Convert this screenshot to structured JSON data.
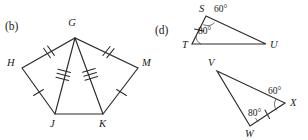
{
  "figures": [
    {
      "id": "figure-b",
      "part_label": "(b)",
      "shape": "pentagon-with-cevians",
      "vertices": [
        {
          "name": "G",
          "label": "G",
          "x": 75,
          "y": 38,
          "label_x": 72,
          "label_y": 26
        },
        {
          "name": "H",
          "label": "H",
          "x": 22,
          "y": 68,
          "label_x": 7,
          "label_y": 66
        },
        {
          "name": "M",
          "label": "M",
          "x": 138,
          "y": 68,
          "label_x": 142,
          "label_y": 66
        },
        {
          "name": "J",
          "label": "J",
          "x": 55,
          "y": 114,
          "label_x": 50,
          "label_y": 127
        },
        {
          "name": "K",
          "label": "K",
          "x": 103,
          "y": 114,
          "label_x": 99,
          "label_y": 127
        }
      ],
      "segments": [
        {
          "name": "HG",
          "from": "H",
          "to": "G",
          "ticks": 2
        },
        {
          "name": "GM",
          "from": "G",
          "to": "M",
          "ticks": 2
        },
        {
          "name": "HJ",
          "from": "H",
          "to": "J",
          "ticks": 1
        },
        {
          "name": "KM",
          "from": "K",
          "to": "M",
          "ticks": 1
        },
        {
          "name": "GJ",
          "from": "G",
          "to": "J",
          "ticks": 3
        },
        {
          "name": "GK",
          "from": "G",
          "to": "K",
          "ticks": 3
        },
        {
          "name": "JK",
          "from": "J",
          "to": "K",
          "ticks": 0
        }
      ]
    },
    {
      "id": "figure-d",
      "part_label": "(d)",
      "shape": "two-triangles",
      "triangles": [
        {
          "name": "triangle-STU",
          "vertices": [
            {
              "name": "S",
              "label": "S",
              "x": 206,
              "y": 16,
              "label_x": 199,
              "label_y": 11
            },
            {
              "name": "T",
              "label": "T",
              "x": 192,
              "y": 44,
              "label_x": 182,
              "label_y": 48
            },
            {
              "name": "U",
              "label": "U",
              "x": 266,
              "y": 44,
              "label_x": 270,
              "label_y": 48
            }
          ],
          "angles": [
            {
              "at": "S",
              "value": "60°",
              "label_x": 214,
              "label_y": 12
            },
            {
              "at": "T",
              "value": "80°",
              "label_x": 198,
              "label_y": 34
            }
          ],
          "ticked_side": {
            "from": "T",
            "to": "S",
            "ticks": 1
          }
        },
        {
          "name": "triangle-VWX",
          "vertices": [
            {
              "name": "V",
              "label": "V",
              "x": 217,
              "y": 71,
              "label_x": 208,
              "label_y": 66
            },
            {
              "name": "X",
              "label": "X",
              "x": 285,
              "y": 103,
              "label_x": 290,
              "label_y": 105
            },
            {
              "name": "W",
              "label": "W",
              "x": 250,
              "y": 126,
              "label_x": 245,
              "label_y": 137
            }
          ],
          "angles": [
            {
              "at": "X",
              "value": "60°",
              "label_x": 268,
              "label_y": 94
            },
            {
              "at": "W",
              "value": "80°",
              "label_x": 250,
              "label_y": 116
            }
          ],
          "ticked_side": {
            "from": "W",
            "to": "X",
            "ticks": 1
          }
        }
      ]
    }
  ],
  "style": {
    "stroke_color": "#2b2b2b",
    "background_color": "#ffffff",
    "text_color": "#1a1a1a"
  }
}
